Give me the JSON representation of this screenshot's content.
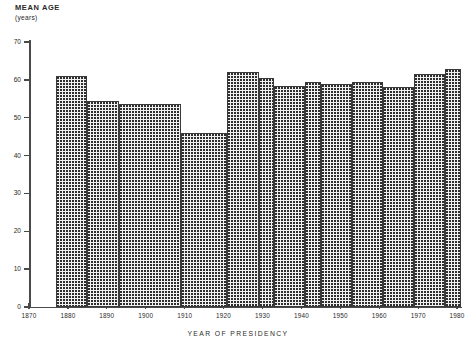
{
  "chart_data": {
    "type": "bar",
    "title": "",
    "xlabel": "YEAR OF PRESIDENCY",
    "ylabel": "MEAN AGE",
    "ylabel_units": "(years)",
    "ylim": [
      0,
      70
    ],
    "xlim": [
      1870,
      1981
    ],
    "yticks": [
      0,
      10,
      20,
      30,
      40,
      50,
      60,
      70
    ],
    "ytick_labels": [
      "0",
      "10",
      "20",
      "30",
      "40",
      "50",
      "60",
      "70"
    ],
    "xticks": [
      1870,
      1880,
      1890,
      1900,
      1910,
      1920,
      1930,
      1940,
      1950,
      1960,
      1970,
      1980
    ],
    "xtick_labels": [
      "1870",
      "1880",
      "1890",
      "1900",
      "1910",
      "1920",
      "1930",
      "1940",
      "1950",
      "1960",
      "1970",
      "1980"
    ],
    "grid": false,
    "legend": null,
    "bars": [
      {
        "start": 1877,
        "end": 1885,
        "value": 61.0
      },
      {
        "start": 1885,
        "end": 1893,
        "value": 54.5
      },
      {
        "start": 1893,
        "end": 1909,
        "value": 53.5
      },
      {
        "start": 1909,
        "end": 1921,
        "value": 46.0
      },
      {
        "start": 1921,
        "end": 1929,
        "value": 62.0
      },
      {
        "start": 1929,
        "end": 1933,
        "value": 60.5
      },
      {
        "start": 1933,
        "end": 1941,
        "value": 58.5
      },
      {
        "start": 1941,
        "end": 1945,
        "value": 59.5
      },
      {
        "start": 1945,
        "end": 1953,
        "value": 59.0
      },
      {
        "start": 1953,
        "end": 1961,
        "value": 59.5
      },
      {
        "start": 1961,
        "end": 1969,
        "value": 58.0
      },
      {
        "start": 1969,
        "end": 1977,
        "value": 61.5
      },
      {
        "start": 1977,
        "end": 1981,
        "value": 63.0
      }
    ]
  },
  "colors": {
    "axis": "#4a4a4a",
    "bar_fill": "#f2f2f2",
    "bar_pattern": "#2e2e2e",
    "bar_border": "#3a3a3a",
    "text": "#2a2a2a"
  }
}
